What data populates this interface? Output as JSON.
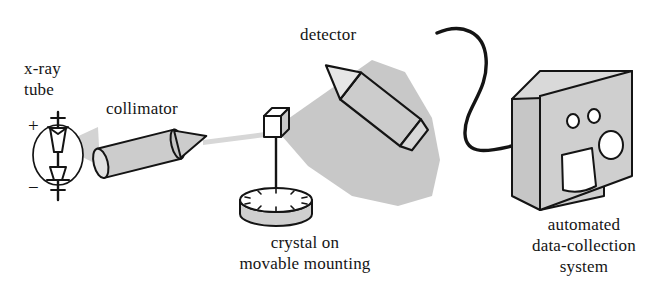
{
  "figure": {
    "background_color": "#ffffff",
    "ink_color": "#141414",
    "shading_color": "#c8c8c8",
    "beam_color": "#d7d7d7",
    "width": 670,
    "height": 296
  },
  "labels": {
    "xray_tube_line1": "x-ray",
    "xray_tube_line2": "tube",
    "collimator": "collimator",
    "detector": "detector",
    "crystal_line1": "crystal on",
    "crystal_line2": "movable mounting",
    "system_line1": "automated",
    "system_line2": "data-collection",
    "system_line3": "system",
    "anode_sign": "+",
    "cathode_sign": "−"
  },
  "components": [
    {
      "name": "x-ray-tube",
      "label": "x-ray tube",
      "shape": "circle-envelope-with-electrode-rod",
      "electrodes": [
        "+",
        "−"
      ],
      "emits": "primary-x-ray-beam"
    },
    {
      "name": "collimator",
      "label": "collimator",
      "shape": "cylinder-with-conical-tip",
      "tilt_degrees": -15,
      "emits": "collimated-beam"
    },
    {
      "name": "crystal",
      "label": "crystal on movable mounting",
      "shape": "cube-on-pin",
      "mounting": "rotatable-graduated-disk",
      "tick_count": 12
    },
    {
      "name": "detector",
      "label": "detector",
      "shape": "conical-probe",
      "orientation": "pointing-down-left-toward-crystal",
      "connected_to": "automated-data-collection-system"
    },
    {
      "name": "automated-data-collection-system",
      "label": "automated data-collection system",
      "shape": "3d-box",
      "front_panel": [
        "indicator-light",
        "indicator-light",
        "reel-dial",
        "paper-printout"
      ]
    }
  ],
  "beams": [
    {
      "name": "primary-beam",
      "from": "x-ray-tube",
      "to": "collimator",
      "style": "diverging-wedge"
    },
    {
      "name": "collimated-beam",
      "from": "collimator",
      "to": "crystal",
      "style": "thin-ray"
    },
    {
      "name": "diffracted-beam",
      "from": "crystal",
      "to": "detector",
      "style": "fan-cone"
    }
  ],
  "cable": {
    "name": "signal-cable",
    "from": "detector",
    "to": "automated-data-collection-system"
  }
}
